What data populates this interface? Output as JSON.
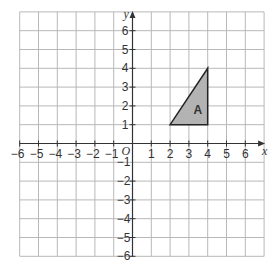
{
  "diagram": {
    "axes": {
      "x_label": "x",
      "y_label": "y",
      "origin_label": "O",
      "x_ticks": [
        "−6",
        "−5",
        "−4",
        "−3",
        "−2",
        "−1",
        "1",
        "2",
        "3",
        "4",
        "5",
        "6"
      ],
      "y_ticks_positive": [
        "1",
        "2",
        "3",
        "4",
        "5",
        "6"
      ],
      "y_ticks_negative": [
        "−1",
        "−2",
        "−3",
        "−4",
        "−5",
        "−6"
      ],
      "x_range": [
        -6,
        7
      ],
      "y_range": [
        -6,
        7
      ]
    },
    "shape": {
      "label": "A",
      "vertices": [
        [
          2,
          1
        ],
        [
          4,
          1
        ],
        [
          4,
          4
        ]
      ],
      "fill": "#b3b3b3",
      "stroke": "#222222"
    },
    "grid_color": "#b8b8b8"
  }
}
